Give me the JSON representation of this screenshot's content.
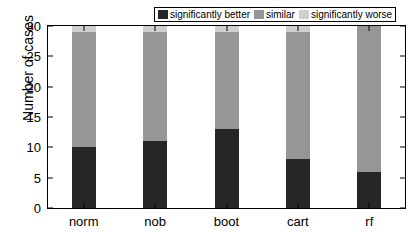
{
  "chart_data": {
    "type": "bar",
    "stacked": true,
    "title": "",
    "xlabel": "",
    "ylabel": "Number of cases",
    "categories": [
      "norm",
      "nob",
      "boot",
      "cart",
      "rf"
    ],
    "series": [
      {
        "name": "significantly better",
        "color": "#262626",
        "values": [
          10,
          11,
          13,
          8,
          6
        ]
      },
      {
        "name": "similar",
        "color": "#969696",
        "values": [
          19,
          18,
          16,
          21,
          24
        ]
      },
      {
        "name": "significantly worse",
        "color": "#cfcfcf",
        "values": [
          1,
          1,
          1,
          1,
          0
        ]
      }
    ],
    "ylim": [
      0,
      30
    ],
    "yticks": [
      0,
      5,
      10,
      15,
      20,
      25,
      30
    ],
    "yticklabels": [
      "0",
      "5",
      "10",
      "15",
      "20",
      "25",
      "30"
    ],
    "grid": false,
    "legend_position": "top-right",
    "total_per_category": [
      30,
      30,
      30,
      30,
      30
    ]
  },
  "axes": {
    "y_title": "Number of cases",
    "y_tick_labels": [
      "0",
      "5",
      "10",
      "15",
      "20",
      "25",
      "30"
    ],
    "x_tick_labels": [
      "norm",
      "nob",
      "boot",
      "cart",
      "rf"
    ]
  },
  "legend": {
    "entries": [
      {
        "label": "significantly better",
        "color": "#262626"
      },
      {
        "label": "similar",
        "color": "#969696"
      },
      {
        "label": "significantly worse",
        "color": "#cfcfcf"
      }
    ]
  },
  "colors": {
    "axis": "#000000",
    "background": "#ffffff",
    "better": "#262626",
    "similar": "#969696",
    "worse": "#cfcfcf"
  }
}
